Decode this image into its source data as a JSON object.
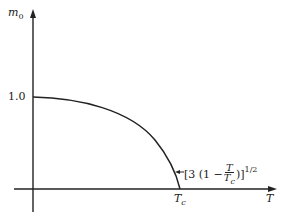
{
  "diagram": {
    "y_axis_label": "m",
    "y_axis_label_sub": "0",
    "x_axis_label": "T",
    "y_tick": "1.0",
    "x_tick": "T",
    "x_tick_sub": "c",
    "annotation": {
      "prefix": "[3 (1 − ",
      "frac_num": "T",
      "frac_den": "T",
      "frac_den_sub": "c",
      "suffix": ")]",
      "exponent": "1/2"
    },
    "colors": {
      "line": "#222222",
      "background": "#ffffff"
    }
  }
}
